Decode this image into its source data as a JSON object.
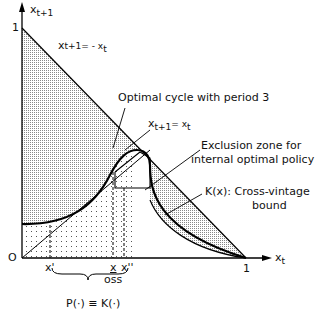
{
  "figure": {
    "axes": {
      "y_label": "x",
      "y_label_sub": "t+1",
      "x_label": "x",
      "x_label_sub": "t",
      "origin": "O",
      "y_max": "1",
      "x_max": "1"
    },
    "lines": {
      "antidiagonal": "x",
      "antidiagonal_rest": "t+1= - x",
      "antidiagonal_sub": "t",
      "diagonal": "x",
      "diagonal_sub1": "t+1",
      "diagonal_eq": "= x",
      "diagonal_sub2": "t"
    },
    "annotations": {
      "cycle": "Optimal cycle with period 3",
      "exclusion_1": "Exclusion zone for",
      "exclusion_2": "internal optimal policy",
      "kx_1": "K(x): Cross-vintage",
      "kx_2": "bound"
    },
    "ticks": {
      "x_prime": "x'",
      "x_under": "x",
      "oss": "oss",
      "x_dprime": "x''"
    },
    "brace_label": "P(·) ≡ K(·)"
  }
}
